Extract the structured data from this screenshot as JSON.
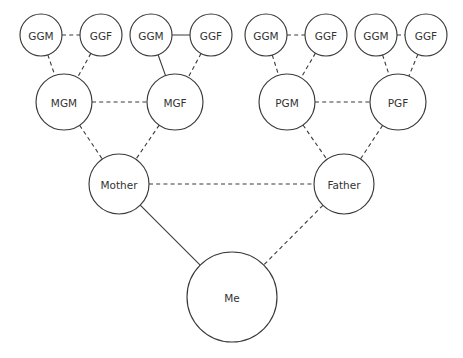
{
  "diagram": {
    "type": "family-tree-pedigree-chart",
    "background_color": "#ffffff",
    "stroke_color": "#3a3a3a",
    "text_color": "#333333",
    "width": 463,
    "height": 358
  },
  "generations": [
    {
      "name": "great-grandparents",
      "level": 1,
      "radius": 21,
      "y": 35,
      "nodes": [
        {
          "id": "ggm1",
          "label": "GGM",
          "cx": 41,
          "cy": 35
        },
        {
          "id": "ggf1",
          "label": "GGF",
          "cx": 101,
          "cy": 35
        },
        {
          "id": "ggm2",
          "label": "GGM",
          "cx": 151,
          "cy": 35
        },
        {
          "id": "ggf2",
          "label": "GGF",
          "cx": 211,
          "cy": 35
        },
        {
          "id": "ggm3",
          "label": "GGM",
          "cx": 266,
          "cy": 35
        },
        {
          "id": "ggf3",
          "label": "GGF",
          "cx": 326,
          "cy": 35
        },
        {
          "id": "ggm4",
          "label": "GGM",
          "cx": 376,
          "cy": 35
        },
        {
          "id": "ggf4",
          "label": "GGF",
          "cx": 426,
          "cy": 35
        }
      ]
    },
    {
      "name": "grandparents",
      "level": 2,
      "radius": 28,
      "y": 102,
      "nodes": [
        {
          "id": "mgm",
          "label": "MGM",
          "cx": 64,
          "cy": 102
        },
        {
          "id": "mgf",
          "label": "MGF",
          "cx": 175,
          "cy": 102
        },
        {
          "id": "pgm",
          "label": "PGM",
          "cx": 287,
          "cy": 102
        },
        {
          "id": "pgf",
          "label": "PGF",
          "cx": 398,
          "cy": 102
        }
      ]
    },
    {
      "name": "parents",
      "level": 3,
      "radius": 30,
      "y": 184,
      "nodes": [
        {
          "id": "mother",
          "label": "Mother",
          "cx": 119,
          "cy": 184
        },
        {
          "id": "father",
          "label": "Father",
          "cx": 344,
          "cy": 184
        }
      ]
    },
    {
      "name": "self",
      "level": 4,
      "radius": 45,
      "y": 297,
      "nodes": [
        {
          "id": "me",
          "label": "Me",
          "cx": 232,
          "cy": 297
        }
      ]
    }
  ],
  "edges": [
    {
      "id": "edge-ggm1-ggf1",
      "from": "ggm1",
      "to": "ggf1",
      "style": "dashed",
      "relation": "partner"
    },
    {
      "id": "edge-ggm2-ggf2",
      "from": "ggm2",
      "to": "ggf2",
      "style": "solid",
      "relation": "partner"
    },
    {
      "id": "edge-ggm3-ggf3",
      "from": "ggm3",
      "to": "ggf3",
      "style": "dashed",
      "relation": "partner"
    },
    {
      "id": "edge-ggm4-ggf4",
      "from": "ggm4",
      "to": "ggf4",
      "style": "dashed",
      "relation": "partner"
    },
    {
      "id": "edge-ggm1-mgm",
      "from": "ggm1",
      "to": "mgm",
      "style": "dashed",
      "relation": "parent"
    },
    {
      "id": "edge-ggf1-mgm",
      "from": "ggf1",
      "to": "mgm",
      "style": "dashed",
      "relation": "parent"
    },
    {
      "id": "edge-ggm2-mgf",
      "from": "ggm2",
      "to": "mgf",
      "style": "solid",
      "relation": "parent"
    },
    {
      "id": "edge-ggf2-mgf",
      "from": "ggf2",
      "to": "mgf",
      "style": "dashed",
      "relation": "parent"
    },
    {
      "id": "edge-ggm3-pgm",
      "from": "ggm3",
      "to": "pgm",
      "style": "dashed",
      "relation": "parent"
    },
    {
      "id": "edge-ggf3-pgm",
      "from": "ggf3",
      "to": "pgm",
      "style": "dashed",
      "relation": "parent"
    },
    {
      "id": "edge-ggm4-pgf",
      "from": "ggm4",
      "to": "pgf",
      "style": "dashed",
      "relation": "parent"
    },
    {
      "id": "edge-ggf4-pgf",
      "from": "ggf4",
      "to": "pgf",
      "style": "dashed",
      "relation": "parent"
    },
    {
      "id": "edge-mgm-mgf",
      "from": "mgm",
      "to": "mgf",
      "style": "dashed",
      "relation": "partner"
    },
    {
      "id": "edge-pgm-pgf",
      "from": "pgm",
      "to": "pgf",
      "style": "dashed",
      "relation": "partner"
    },
    {
      "id": "edge-mgm-mother",
      "from": "mgm",
      "to": "mother",
      "style": "dashed",
      "relation": "parent"
    },
    {
      "id": "edge-mgf-mother",
      "from": "mgf",
      "to": "mother",
      "style": "dashed",
      "relation": "parent"
    },
    {
      "id": "edge-pgm-father",
      "from": "pgm",
      "to": "father",
      "style": "dashed",
      "relation": "parent"
    },
    {
      "id": "edge-pgf-father",
      "from": "pgf",
      "to": "father",
      "style": "dashed",
      "relation": "parent"
    },
    {
      "id": "edge-mother-father",
      "from": "mother",
      "to": "father",
      "style": "dashed",
      "relation": "partner"
    },
    {
      "id": "edge-mother-me",
      "from": "mother",
      "to": "me",
      "style": "solid",
      "relation": "parent"
    },
    {
      "id": "edge-father-me",
      "from": "father",
      "to": "me",
      "style": "dashed",
      "relation": "parent"
    }
  ]
}
